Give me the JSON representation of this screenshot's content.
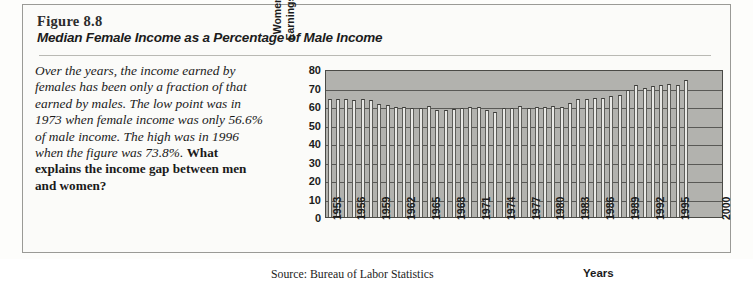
{
  "figure": {
    "number": "Figure 8.8",
    "title": "Median Female Income as a Percentage of Male Income",
    "caption_italic": "Over the years, the income earned by females has been only a fraction of that earned by males. The low point was in 1973 when female income was only 56.6% of male income. The high was in 1996 when the figure was 73.8%.",
    "caption_question": "What explains the income gap between men and women?",
    "source": "Source: Bureau of Labor Statistics"
  },
  "chart_data": {
    "type": "bar",
    "title": "Median Female Income as a Percentage of Male Income",
    "xlabel": "Years",
    "ylabel": "Women/Men Earnings Ratio",
    "ylabel_lines": [
      "Women/Men",
      "Earnings Ratio"
    ],
    "ylim": [
      0,
      80
    ],
    "yticks": [
      0,
      10,
      20,
      30,
      40,
      50,
      60,
      70,
      80
    ],
    "xlim": [
      1953,
      2000
    ],
    "xticks": [
      "1953",
      "1956",
      "1959",
      "1962",
      "1965",
      "1968",
      "1971",
      "1974",
      "1977",
      "1980",
      "1983",
      "1986",
      "1989",
      "1992",
      "1995",
      "2000"
    ],
    "grid": true,
    "legend": "none",
    "bar_color": "#e9e9e6",
    "plot_background": "#b2b2ae",
    "categories": [
      1953,
      1954,
      1955,
      1956,
      1957,
      1958,
      1959,
      1960,
      1961,
      1962,
      1963,
      1964,
      1965,
      1966,
      1967,
      1968,
      1969,
      1970,
      1971,
      1972,
      1973,
      1974,
      1975,
      1976,
      1977,
      1978,
      1979,
      1980,
      1981,
      1982,
      1983,
      1984,
      1985,
      1986,
      1987,
      1988,
      1989,
      1990,
      1991,
      1992,
      1993,
      1994,
      1995,
      1996
    ],
    "values": [
      63.9,
      63.6,
      63.9,
      63.3,
      63.8,
      63.0,
      61.3,
      60.7,
      59.2,
      59.3,
      58.9,
      59.1,
      59.9,
      57.6,
      57.8,
      58.2,
      58.9,
      59.4,
      59.5,
      57.9,
      56.6,
      58.8,
      58.8,
      60.2,
      58.9,
      59.4,
      59.7,
      60.2,
      59.2,
      61.7,
      63.6,
      63.7,
      64.6,
      64.3,
      65.2,
      66.0,
      68.7,
      71.6,
      69.9,
      70.8,
      71.5,
      72.0,
      71.4,
      73.8
    ]
  }
}
